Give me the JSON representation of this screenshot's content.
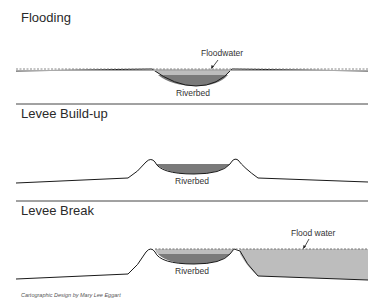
{
  "panels": [
    {
      "title": "Flooding",
      "labels": {
        "water": "Floodwater",
        "riverbed": "Riverbed"
      }
    },
    {
      "title": "Levee Build-up",
      "labels": {
        "riverbed": "Riverbed"
      }
    },
    {
      "title": "Levee Break",
      "labels": {
        "water": "Flood water",
        "riverbed": "Riverbed"
      }
    }
  ],
  "credit": "Cartographic Design by Mary Lee Eggart",
  "colors": {
    "riverbed_fill": "#7a7a7a",
    "water_fill": "#bdbdbd",
    "ground_line": "#1a1a1a",
    "divider": "#444444"
  }
}
